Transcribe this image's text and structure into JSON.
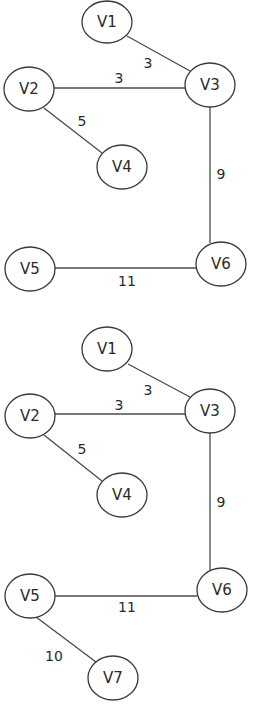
{
  "diagram": {
    "type": "weighted-graph",
    "graphs": [
      {
        "id": "graph-top",
        "nodes": [
          {
            "id": "V1",
            "label": "V1",
            "x": 107,
            "y": 22
          },
          {
            "id": "V2",
            "label": "V2",
            "x": 29,
            "y": 89
          },
          {
            "id": "V3",
            "label": "V3",
            "x": 210,
            "y": 85
          },
          {
            "id": "V4",
            "label": "V4",
            "x": 122,
            "y": 167
          },
          {
            "id": "V5",
            "label": "V5",
            "x": 30,
            "y": 269
          },
          {
            "id": "V6",
            "label": "V6",
            "x": 221,
            "y": 264
          }
        ],
        "edges": [
          {
            "from": "V1",
            "to": "V3",
            "weight": "3",
            "label_x": 148,
            "label_y": 63
          },
          {
            "from": "V2",
            "to": "V3",
            "weight": "3",
            "label_x": 119,
            "label_y": 78
          },
          {
            "from": "V2",
            "to": "V4",
            "weight": "5",
            "label_x": 82,
            "label_y": 121
          },
          {
            "from": "V3",
            "to": "V6",
            "weight": "9",
            "label_x": 221,
            "label_y": 174
          },
          {
            "from": "V5",
            "to": "V6",
            "weight": "11",
            "label_x": 127,
            "label_y": 281
          }
        ]
      },
      {
        "id": "graph-bottom",
        "nodes": [
          {
            "id": "V1",
            "label": "V1",
            "x": 107,
            "y": 349
          },
          {
            "id": "V2",
            "label": "V2",
            "x": 30,
            "y": 416
          },
          {
            "id": "V3",
            "label": "V3",
            "x": 210,
            "y": 411
          },
          {
            "id": "V4",
            "label": "V4",
            "x": 122,
            "y": 495
          },
          {
            "id": "V5",
            "label": "V5",
            "x": 30,
            "y": 596
          },
          {
            "id": "V6",
            "label": "V6",
            "x": 222,
            "y": 590
          },
          {
            "id": "V7",
            "label": "V7",
            "x": 113,
            "y": 678
          }
        ],
        "edges": [
          {
            "from": "V1",
            "to": "V3",
            "weight": "3",
            "label_x": 148,
            "label_y": 390
          },
          {
            "from": "V2",
            "to": "V3",
            "weight": "3",
            "label_x": 119,
            "label_y": 405
          },
          {
            "from": "V2",
            "to": "V4",
            "weight": "5",
            "label_x": 82,
            "label_y": 449
          },
          {
            "from": "V3",
            "to": "V6",
            "weight": "9",
            "label_x": 221,
            "label_y": 502
          },
          {
            "from": "V5",
            "to": "V6",
            "weight": "11",
            "label_x": 127,
            "label_y": 607
          },
          {
            "from": "V5",
            "to": "V7",
            "weight": "10",
            "label_x": 54,
            "label_y": 656
          }
        ]
      }
    ],
    "style": {
      "node_rx": 25,
      "node_ry": 22,
      "stroke_color": "#3a3a3a",
      "background": "#ffffff"
    }
  }
}
